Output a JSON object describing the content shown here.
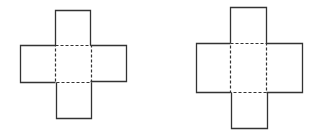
{
  "diagram": {
    "stroke_color": "#333333",
    "background": "#ffffff",
    "figures": [
      {
        "name": "left-cross-net",
        "solid_rects": [
          {
            "x": 55,
            "y": 10,
            "w": 35,
            "h": 35
          },
          {
            "x": 20,
            "y": 45,
            "w": 35,
            "h": 37
          },
          {
            "x": 90,
            "y": 45,
            "w": 36,
            "h": 36
          },
          {
            "x": 56,
            "y": 82,
            "w": 35,
            "h": 36
          }
        ],
        "dashed_center": {
          "x": 55,
          "y": 45,
          "w": 36,
          "h": 37
        }
      },
      {
        "name": "right-cross-net",
        "solid_rects": [
          {
            "x": 230,
            "y": 7,
            "w": 36,
            "h": 36
          },
          {
            "x": 196,
            "y": 43,
            "w": 34,
            "h": 49
          },
          {
            "x": 266,
            "y": 43,
            "w": 36,
            "h": 49
          },
          {
            "x": 231,
            "y": 92,
            "w": 36,
            "h": 36
          }
        ],
        "dashed_center": {
          "x": 230,
          "y": 43,
          "w": 36,
          "h": 49
        }
      }
    ]
  }
}
